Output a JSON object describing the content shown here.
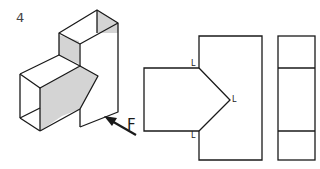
{
  "figure": {
    "number": "4",
    "arrow_label": "F",
    "corner_labels": [
      "L",
      "L",
      "L"
    ]
  },
  "colors": {
    "line": "#1a1a1a",
    "shade": "#d4d4d4",
    "background": "#ffffff"
  }
}
